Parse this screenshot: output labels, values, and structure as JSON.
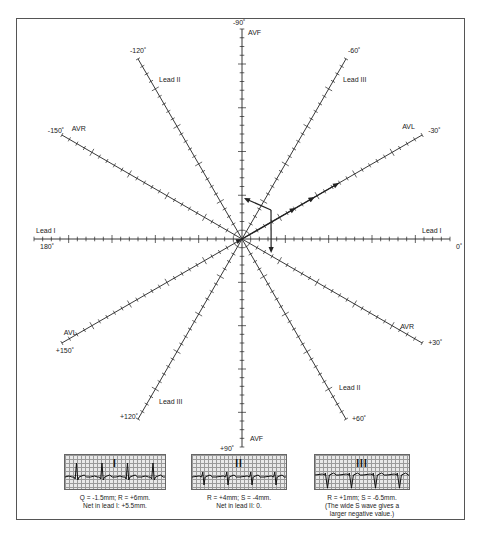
{
  "diagram": {
    "colors": {
      "line": "#222222",
      "frame": "#555555",
      "grid_bg": "#e9e9e9",
      "grid_line": "#9a9a9a"
    },
    "axes": [
      {
        "angle": 0,
        "degree_label": "0˚",
        "lead_label": "Lead I"
      },
      {
        "angle": 180,
        "degree_label": "180˚",
        "lead_label": "Lead I"
      },
      {
        "angle": -30,
        "degree_label": "-30˚",
        "lead_label": "AVL"
      },
      {
        "angle": 150,
        "degree_label": "+150˚",
        "lead_label": "AVL"
      },
      {
        "angle": -60,
        "degree_label": "-60˚",
        "lead_label": "Lead III"
      },
      {
        "angle": 120,
        "degree_label": "+120˚",
        "lead_label": "Lead III"
      },
      {
        "angle": -90,
        "degree_label": "-90˚",
        "lead_label": "AVF"
      },
      {
        "angle": 90,
        "degree_label": "+90˚",
        "lead_label": "AVF"
      },
      {
        "angle": -120,
        "degree_label": "-120˚",
        "lead_label": "Lead II"
      },
      {
        "angle": 60,
        "degree_label": "+60˚",
        "lead_label": "Lead II"
      },
      {
        "angle": -150,
        "degree_label": "-150˚",
        "lead_label": "AVR"
      },
      {
        "angle": 30,
        "degree_label": "+30˚",
        "lead_label": "AVR"
      }
    ],
    "vectors": [
      {
        "name": "lead-I-net",
        "lead": "Lead I",
        "value_mm": 5.5
      },
      {
        "name": "lead-III-net",
        "lead": "Lead III",
        "value_mm": -5.5
      },
      {
        "name": "resultant-axis",
        "approx_angle_deg": -30
      }
    ]
  },
  "strips": [
    {
      "roman": "I",
      "caption": [
        "Q = -1.5mm; R = +6mm.",
        "Net in lead I: +5.5mm."
      ]
    },
    {
      "roman": "II",
      "caption": [
        "R = +4mm; S = -4mm.",
        "Net in lead II: 0."
      ]
    },
    {
      "roman": "III",
      "caption": [
        "R = +1mm; S = -6.5mm.",
        "(The wide S wave gives a",
        "larger negative value.)"
      ]
    }
  ]
}
